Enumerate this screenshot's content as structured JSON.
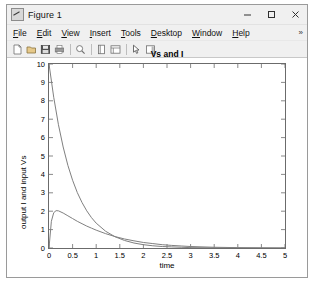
{
  "window": {
    "title": "Figure 1",
    "app_icon": "matlab-figure-icon",
    "controls": {
      "minimize": "minimize",
      "maximize": "maximize",
      "close": "close"
    }
  },
  "menubar": {
    "items": [
      {
        "label": "File",
        "mnemonic": "F"
      },
      {
        "label": "Edit",
        "mnemonic": "E"
      },
      {
        "label": "View",
        "mnemonic": "V"
      },
      {
        "label": "Insert",
        "mnemonic": "I"
      },
      {
        "label": "Tools",
        "mnemonic": "T"
      },
      {
        "label": "Desktop",
        "mnemonic": "D"
      },
      {
        "label": "Window",
        "mnemonic": "W"
      },
      {
        "label": "Help",
        "mnemonic": "H"
      }
    ],
    "overflow": "»"
  },
  "toolbar": {
    "buttons": [
      {
        "name": "new-figure-icon",
        "tooltip": "New Figure"
      },
      {
        "name": "open-file-icon",
        "tooltip": "Open File"
      },
      {
        "name": "save-figure-icon",
        "tooltip": "Save Figure"
      },
      {
        "name": "print-figure-icon",
        "tooltip": "Print Figure"
      },
      {
        "name": "zoom-icon",
        "tooltip": "Zoom"
      },
      {
        "name": "data-cursor-icon",
        "tooltip": "Data Cursor"
      },
      {
        "name": "insert-legend-icon",
        "tooltip": "Insert Legend"
      },
      {
        "name": "edit-plot-icon",
        "tooltip": "Edit Plot"
      },
      {
        "name": "insert-colorbar-icon",
        "tooltip": "Insert Colorbar"
      }
    ]
  },
  "colors": {
    "window_bg": "#f0f0f0",
    "canvas_bg": "#ffffff",
    "axes_line": "#6b6b6b",
    "curve": "#808080",
    "text": "#000000"
  },
  "chart_data": {
    "type": "line",
    "title": "Vs and I",
    "xlabel": "time",
    "ylabel": "output I and input Vs",
    "xlim": [
      0,
      5
    ],
    "ylim": [
      0,
      10
    ],
    "xticks": [
      0,
      0.5,
      1,
      1.5,
      2,
      2.5,
      3,
      3.5,
      4,
      4.5,
      5
    ],
    "xtick_labels": [
      "0",
      "0.5",
      "1",
      "1.5",
      "2",
      "2.5",
      "3",
      "3.5",
      "4",
      "4.5",
      "5"
    ],
    "yticks": [
      0,
      1,
      2,
      3,
      4,
      5,
      6,
      7,
      8,
      9,
      10
    ],
    "ytick_labels": [
      "0",
      "1",
      "2",
      "3",
      "4",
      "5",
      "6",
      "7",
      "8",
      "9",
      "10"
    ],
    "grid": false,
    "legend": null,
    "series": [
      {
        "name": "Vs",
        "color": "#808080",
        "x": [
          0,
          0.1,
          0.2,
          0.3,
          0.4,
          0.5,
          0.6,
          0.7,
          0.8,
          0.9,
          1.0,
          1.2,
          1.4,
          1.6,
          1.8,
          2.0,
          2.2,
          2.4,
          2.6,
          2.8,
          3.0,
          3.5,
          4.0,
          4.5,
          5.0
        ],
        "y": [
          10.0,
          8.19,
          6.7,
          5.49,
          4.49,
          3.68,
          3.01,
          2.47,
          2.02,
          1.65,
          1.35,
          0.91,
          0.61,
          0.41,
          0.27,
          0.18,
          0.12,
          0.08,
          0.06,
          0.04,
          0.02,
          0.01,
          0.0,
          0.0,
          0.0
        ]
      },
      {
        "name": "I",
        "color": "#808080",
        "x": [
          0,
          0.05,
          0.1,
          0.15,
          0.2,
          0.3,
          0.4,
          0.5,
          0.6,
          0.7,
          0.8,
          0.9,
          1.0,
          1.2,
          1.4,
          1.6,
          1.8,
          2.0,
          2.2,
          2.4,
          2.6,
          2.8,
          3.0,
          3.5,
          4.0,
          4.5,
          5.0
        ],
        "y": [
          0.0,
          1.45,
          1.92,
          2.03,
          2.02,
          1.9,
          1.75,
          1.6,
          1.45,
          1.32,
          1.19,
          1.08,
          0.97,
          0.78,
          0.62,
          0.49,
          0.39,
          0.3,
          0.24,
          0.18,
          0.14,
          0.11,
          0.08,
          0.04,
          0.02,
          0.01,
          0.0
        ]
      }
    ]
  }
}
